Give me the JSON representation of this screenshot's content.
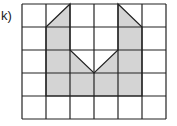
{
  "label": "k)",
  "grid": {
    "cols": 6,
    "rows": 5,
    "x0": 22,
    "y0": 4,
    "cw": 24,
    "ch": 23
  },
  "colors": {
    "fill": "#d4d4d4",
    "line": "#222222"
  },
  "shape_polygon": [
    [
      1,
      1
    ],
    [
      2,
      0
    ],
    [
      2,
      2
    ],
    [
      3,
      3
    ],
    [
      4,
      2
    ],
    [
      4,
      0
    ],
    [
      5,
      1
    ],
    [
      5,
      4
    ],
    [
      1,
      4
    ]
  ]
}
